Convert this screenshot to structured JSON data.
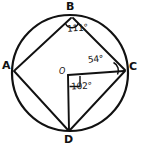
{
  "figure": {
    "stroke_color": "#111111",
    "background_color": "#ffffff"
  },
  "circle": {
    "center_label": "O",
    "cx": 70,
    "cy": 73,
    "r": 58
  },
  "vertices": [
    {
      "name": "A",
      "label": "A",
      "x": 13,
      "y": 70
    },
    {
      "name": "B",
      "label": "B",
      "x": 72,
      "y": 15
    },
    {
      "name": "C",
      "label": "C",
      "x": 125,
      "y": 70
    },
    {
      "name": "D",
      "label": "D",
      "x": 69,
      "y": 131
    }
  ],
  "angles": [
    {
      "name": "angle-at-B",
      "label": "111°",
      "vertex": "B",
      "value": 111
    },
    {
      "name": "angle-at-C",
      "label": "54°",
      "vertex": "C",
      "value": 54
    },
    {
      "name": "angle-at-O",
      "label": "102°",
      "vertex": "O",
      "value": 102
    }
  ],
  "segments": [
    {
      "from": "A",
      "to": "B"
    },
    {
      "from": "B",
      "to": "C"
    },
    {
      "from": "C",
      "to": "D"
    },
    {
      "from": "D",
      "to": "A"
    },
    {
      "from": "O",
      "to": "C"
    },
    {
      "from": "O",
      "to": "D"
    }
  ]
}
